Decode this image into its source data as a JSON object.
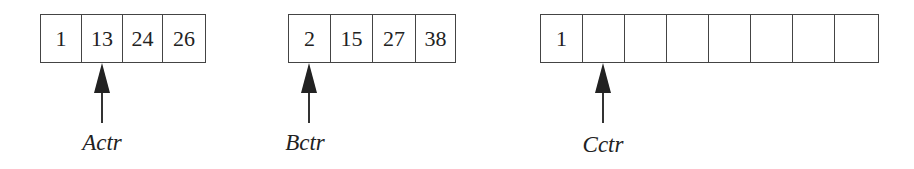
{
  "diagram": {
    "arrays": [
      {
        "name": "A",
        "cells": [
          "1",
          "13",
          "24",
          "26"
        ],
        "pointer_label": "Actr",
        "pointer_index": 1
      },
      {
        "name": "B",
        "cells": [
          "2",
          "15",
          "27",
          "38"
        ],
        "pointer_label": "Bctr",
        "pointer_index": 0
      },
      {
        "name": "C",
        "cells": [
          "1",
          "",
          "",
          "",
          "",
          "",
          "",
          ""
        ],
        "pointer_label": "Cctr",
        "pointer_index": 1
      }
    ]
  }
}
